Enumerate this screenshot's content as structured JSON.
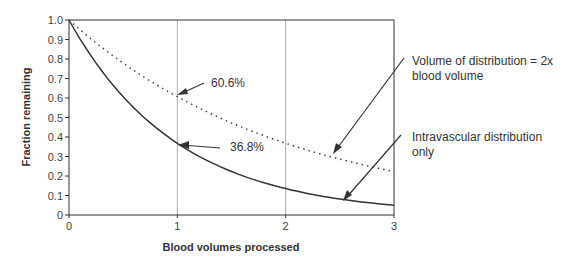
{
  "chart_data": {
    "type": "line",
    "title": "",
    "xlabel": "Blood volumes processed",
    "ylabel": "Fraction remaining",
    "xlim": [
      0,
      3
    ],
    "ylim": [
      0,
      1.0
    ],
    "x_ticks": [
      "0",
      "1",
      "2",
      "3"
    ],
    "y_ticks": [
      "0",
      "0.1",
      "0.2",
      "0.3",
      "0.4",
      "0.5",
      "0.6",
      "0.7",
      "0.8",
      "0.9",
      "1.0"
    ],
    "grid": "vertical lines at x=1 and x=2",
    "series": [
      {
        "name": "Intravascular distribution only",
        "style": "solid",
        "formula": "exp(-x)",
        "x": [
          0,
          0.5,
          1,
          1.5,
          2,
          2.5,
          3
        ],
        "values": [
          1.0,
          0.607,
          0.368,
          0.223,
          0.135,
          0.082,
          0.05
        ]
      },
      {
        "name": "Volume of distribution = 2x blood volume",
        "style": "dotted",
        "formula": "exp(-x/2)",
        "x": [
          0,
          0.5,
          1,
          1.5,
          2,
          2.5,
          3
        ],
        "values": [
          1.0,
          0.779,
          0.606,
          0.472,
          0.368,
          0.287,
          0.223
        ]
      }
    ],
    "annotations": [
      {
        "text": "60.6%",
        "x": 1,
        "y": 0.606
      },
      {
        "text": "36.8%",
        "x": 1,
        "y": 0.368
      },
      {
        "text": "Volume of distribution = 2x blood volume",
        "target": "dotted curve"
      },
      {
        "text": "Intravascular distribution only",
        "target": "solid curve"
      }
    ]
  },
  "labels": {
    "ann1": "60.6%",
    "ann2": "36.8%",
    "legend1_line1": "Volume of distribution = 2x",
    "legend1_line2": "blood volume",
    "legend2_line1": "Intravascular distribution",
    "legend2_line2": "only"
  }
}
